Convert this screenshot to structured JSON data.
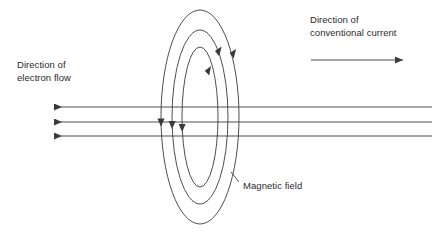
{
  "diagram": {
    "background_color": "#ffffff",
    "stroke_color": "#3a3a3a",
    "text_color": "#2b2b2b",
    "labels": {
      "electron_flow": "Direction of\nelectron flow",
      "conventional_current": "Direction of\nconventional current",
      "magnetic_field": "Magnetic field"
    },
    "field_lines": {
      "count": 3,
      "center_x": 200,
      "center_y": 117,
      "ellipses": [
        {
          "rx": 39,
          "ry": 107
        },
        {
          "rx": 28,
          "ry": 87
        },
        {
          "rx": 18,
          "ry": 70
        }
      ],
      "rotation_sense": "clockwise-from-front",
      "arrow_up_count": 3,
      "arrow_down_count": 3
    },
    "wire": {
      "line_count": 3,
      "line_y": [
        107,
        122,
        136
      ],
      "x_start": 52,
      "x_end": 432,
      "arrow_direction": "left",
      "meaning": "electron flow"
    },
    "current_arrow": {
      "x_start": 311,
      "x_end": 405,
      "y": 60,
      "direction": "right"
    }
  }
}
